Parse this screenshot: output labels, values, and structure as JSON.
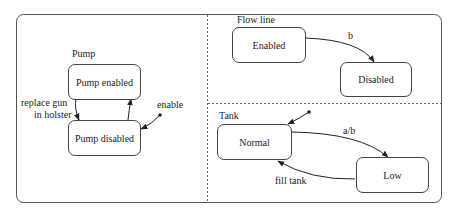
{
  "diagram": {
    "type": "statechart",
    "regions": {
      "pump": {
        "title": "Pump",
        "states": {
          "enabled": "Pump enabled",
          "disabled": "Pump disabled"
        },
        "transitions": {
          "to_disabled_line1": "replace gun",
          "to_disabled_line2": "in holster",
          "initial": "enable"
        }
      },
      "flow_line": {
        "title": "Flow line",
        "states": {
          "enabled": "Enabled",
          "disabled": "Disabled"
        },
        "transitions": {
          "enabled_to_disabled": "b"
        }
      },
      "tank": {
        "title": "Tank",
        "states": {
          "normal": "Normal",
          "low": "Low"
        },
        "transitions": {
          "normal_to_low": "a/b",
          "low_to_normal": "fill tank"
        }
      }
    },
    "colors": {
      "line": "#444444",
      "divider": "#666666",
      "text": "#222222"
    }
  }
}
